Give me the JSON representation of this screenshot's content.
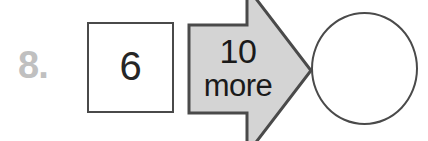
{
  "problem": {
    "number_label": "8.",
    "number_color": "#c0c0c0",
    "start_value": "6",
    "operand": "10",
    "operation_word": "more",
    "answer_value": "",
    "answer_placeholder": "",
    "box_border_color": "#4a4a4a",
    "arrow_fill_color": "#d4d4d4",
    "arrow_stroke_color": "#4a4a4a",
    "text_color": "#1a1a1a",
    "background_color": "#ffffff"
  },
  "icons": {
    "arrow": "right-arrow-icon",
    "start_box": "square-shape-icon",
    "answer_shape": "circle-shape-icon"
  }
}
